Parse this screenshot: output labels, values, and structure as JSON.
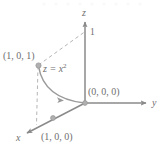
{
  "figure": {
    "colors": {
      "axis": "#8a8a8a",
      "curve": "#9a9a9a",
      "dashed": "#b5b5b5",
      "label": "#6f6f6f",
      "point": "#a8a8a8",
      "background": "#ffffff"
    },
    "axes": {
      "x_label": "x",
      "y_label": "y",
      "z_label": "z"
    },
    "ticks": {
      "z_one": "1"
    },
    "points": [
      {
        "name": "point-1-0-1",
        "label": "(1, 0, 1)",
        "x": 1,
        "y": 0,
        "z": 1
      },
      {
        "name": "point-0-0-0",
        "label": "(0, 0, 0)",
        "x": 0,
        "y": 0,
        "z": 0
      },
      {
        "name": "point-1-0-0",
        "label": "(1, 0, 0)",
        "x": 1,
        "y": 0,
        "z": 0
      }
    ],
    "curve": {
      "name": "parabola",
      "equation_text": "z = x",
      "equation_exponent": "2",
      "description": "parabola z = x^2 in the xz-plane from (1,0,1) to (0,0,0)",
      "direction": "toward origin"
    }
  }
}
